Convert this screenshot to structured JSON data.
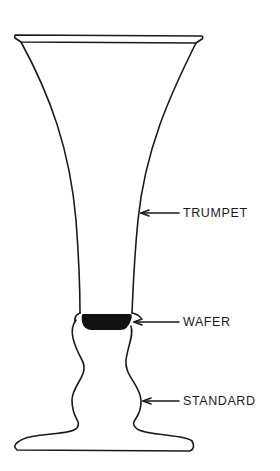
{
  "diagram": {
    "line_color": "#1a1a1a",
    "fill_color": "#ffffff",
    "labels": [
      {
        "key": "trumpet",
        "text": "TRUMPET",
        "x": 183,
        "y": 207
      },
      {
        "key": "wafer",
        "text": "WAFER",
        "x": 183,
        "y": 317
      },
      {
        "key": "standard",
        "text": "STANDARD",
        "x": 183,
        "y": 396
      }
    ],
    "parts": [
      "rim",
      "trumpet",
      "wafer",
      "standard",
      "foot"
    ]
  }
}
